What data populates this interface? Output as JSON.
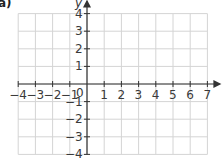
{
  "part_label": "a)",
  "axes": {
    "x_label": "x",
    "y_label": "y",
    "x_range": [
      -4,
      7
    ],
    "y_range": [
      -4,
      4
    ],
    "x_ticks": [
      "−4",
      "−3",
      "−2",
      "−1",
      "0",
      "1",
      "2",
      "3",
      "4",
      "5",
      "6",
      "7"
    ],
    "y_ticks_pos": [
      "4",
      "3",
      "2",
      "1"
    ],
    "y_ticks_neg": [
      "−1",
      "−2",
      "−3",
      "−4"
    ],
    "origin_label": "0"
  },
  "colors": {
    "grid": "#d4d4d4",
    "axis": "#333333",
    "text": "#3a3a3a"
  },
  "chart_data": {
    "type": "scatter",
    "title": "",
    "xlabel": "x",
    "ylabel": "y",
    "xlim": [
      -4,
      7
    ],
    "ylim": [
      -4,
      4
    ],
    "grid": true,
    "series": []
  }
}
